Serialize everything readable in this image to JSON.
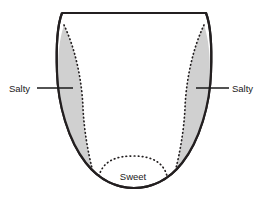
{
  "figure": {
    "background_color": "#ffffff"
  },
  "tongue": {
    "outline_color": "#231f20",
    "outline_width": 2.2,
    "fill_color": "#ffffff",
    "zone_fill_color": "#d0d0d0",
    "dotted_color": "#231f20"
  },
  "labels": {
    "salty_left": "Salty",
    "salty_right": "Salty",
    "sweet": "Sweet"
  },
  "zones": [
    {
      "name": "salty-left-zone",
      "taste": "Salty",
      "side": "left",
      "shaded": true
    },
    {
      "name": "salty-right-zone",
      "taste": "Salty",
      "side": "right",
      "shaded": true
    },
    {
      "name": "sweet-zone",
      "taste": "Sweet",
      "side": "tip",
      "shaded": false
    }
  ],
  "leaders": {
    "left": {
      "x1": 37,
      "x2": 73,
      "y": 88
    },
    "right": {
      "x1": 196,
      "x2": 229,
      "y": 88
    }
  }
}
